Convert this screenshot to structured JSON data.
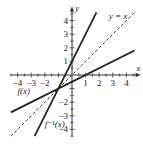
{
  "chart_data": {
    "type": "line",
    "title": "",
    "xlabel": "x",
    "ylabel": "y",
    "xlim": [
      -4.5,
      4.6
    ],
    "ylim": [
      -4.5,
      4.6
    ],
    "grid": false,
    "x_ticks": [
      -4,
      -3,
      -2,
      1,
      2,
      3,
      4
    ],
    "y_ticks": [
      4,
      3,
      2,
      1,
      -2,
      -3,
      -4
    ],
    "x_tick_labels": [
      "−4",
      "−3",
      "−2",
      "1",
      "2",
      "3",
      "4"
    ],
    "y_tick_labels": [
      "4",
      "3",
      "2",
      "1",
      "−2",
      "−3",
      "−4"
    ],
    "series": [
      {
        "name": "f(x)",
        "label": "f(x)",
        "style": "solid",
        "slope": 0.5,
        "intercept": -0.5,
        "x": [
          -4.5,
          4.6
        ],
        "y": [
          -2.75,
          1.8
        ]
      },
      {
        "name": "f^-1(x)",
        "label": "f⁻¹(x)",
        "style": "solid",
        "slope": 2,
        "intercept": 1,
        "x": [
          -2.75,
          1.8
        ],
        "y": [
          -4.5,
          4.6
        ]
      },
      {
        "name": "y = x",
        "label": "y = x",
        "style": "dashed",
        "slope": 1,
        "intercept": 0,
        "x": [
          -4.5,
          4.6
        ],
        "y": [
          -4.5,
          4.6
        ]
      }
    ],
    "annotations": [
      {
        "text": "y = x",
        "x": 2.7,
        "y": 4.1
      },
      {
        "text": "f(x)",
        "x": -4.0,
        "y": -1.4
      },
      {
        "text": "f⁻¹(x)",
        "x": -2.0,
        "y": -3.8
      }
    ]
  }
}
